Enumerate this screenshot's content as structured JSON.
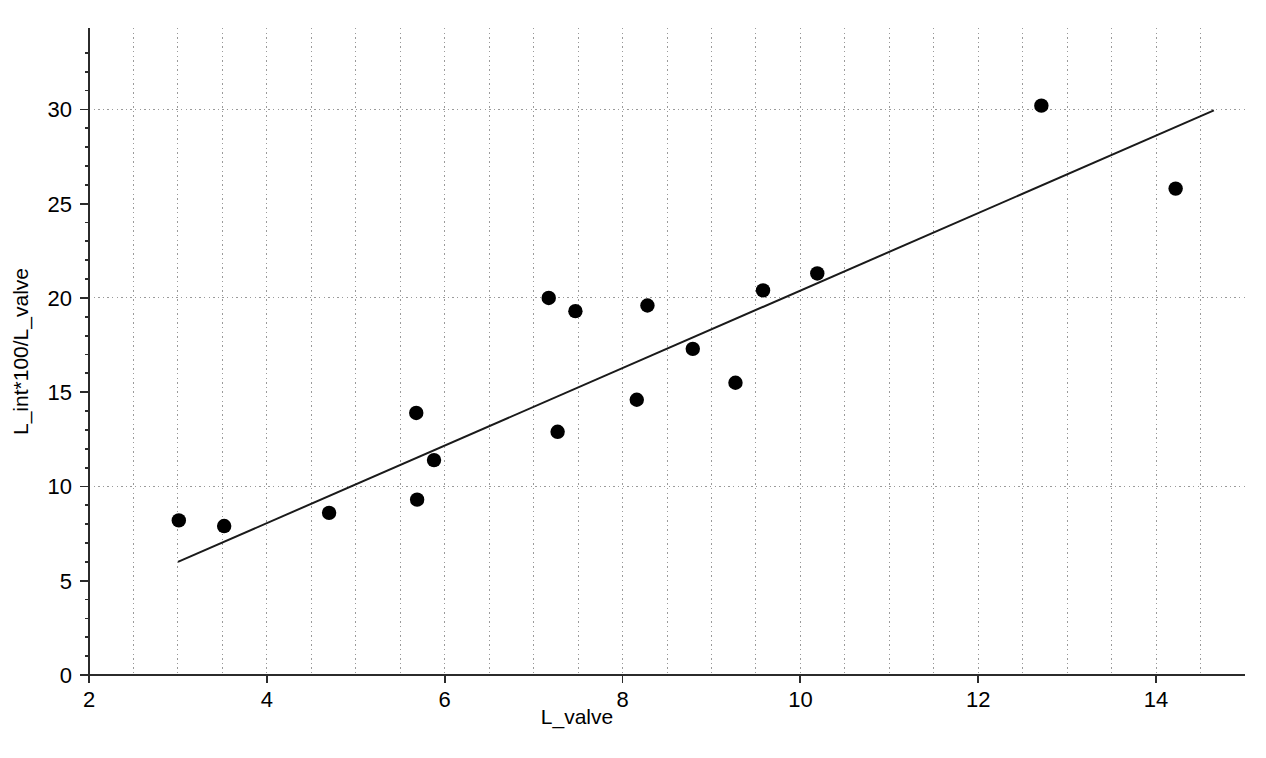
{
  "chart_data": {
    "type": "scatter",
    "title": "",
    "xlabel": "L_valve",
    "ylabel": "L_int*100/L_valve",
    "xlim": [
      2,
      15
    ],
    "ylim": [
      0,
      34
    ],
    "xticks": [
      2,
      4,
      6,
      8,
      10,
      12,
      14
    ],
    "yticks": [
      0,
      5,
      10,
      15,
      20,
      25,
      30
    ],
    "xtick_labels": [
      "2",
      "4",
      "6",
      "8",
      "10",
      "12",
      "14"
    ],
    "ytick_labels": [
      "0",
      "5",
      "10",
      "15",
      "20",
      "25",
      "30"
    ],
    "grid": true,
    "grid_x_step": 0.5,
    "grid_y_values": [
      10,
      20,
      30
    ],
    "legend": "none",
    "marker": "filled-circle",
    "marker_color": "#000000",
    "point_count": 17,
    "x": [
      3.01,
      3.52,
      4.7,
      5.68,
      5.69,
      5.88,
      7.17,
      7.27,
      7.47,
      8.16,
      8.28,
      8.79,
      9.27,
      9.58,
      10.19,
      12.71,
      14.22
    ],
    "y": [
      8.2,
      7.9,
      8.6,
      13.9,
      9.3,
      11.4,
      20.0,
      12.9,
      19.3,
      14.6,
      19.6,
      17.3,
      15.5,
      20.4,
      21.3,
      30.2,
      25.8
    ],
    "points": [
      {
        "x": 3.01,
        "y": 8.2
      },
      {
        "x": 3.52,
        "y": 7.9
      },
      {
        "x": 4.7,
        "y": 8.6
      },
      {
        "x": 5.68,
        "y": 13.9
      },
      {
        "x": 5.69,
        "y": 9.3
      },
      {
        "x": 5.88,
        "y": 11.4
      },
      {
        "x": 7.17,
        "y": 20.0
      },
      {
        "x": 7.27,
        "y": 12.9
      },
      {
        "x": 7.47,
        "y": 19.3
      },
      {
        "x": 8.16,
        "y": 14.6
      },
      {
        "x": 8.28,
        "y": 19.6
      },
      {
        "x": 8.79,
        "y": 17.3
      },
      {
        "x": 9.27,
        "y": 15.5
      },
      {
        "x": 9.58,
        "y": 20.4
      },
      {
        "x": 10.19,
        "y": 21.3
      },
      {
        "x": 12.71,
        "y": 30.2
      },
      {
        "x": 14.22,
        "y": 25.8
      }
    ],
    "trendline": {
      "type": "linear",
      "x_start": 3.0,
      "y_start": 6.0,
      "x_end": 14.65,
      "y_end": 29.95,
      "color": "#1a1a1a"
    }
  }
}
